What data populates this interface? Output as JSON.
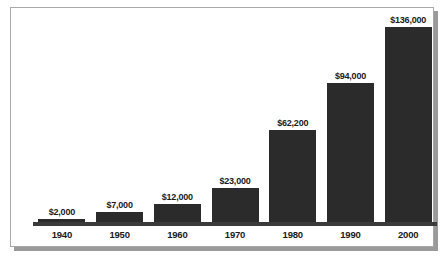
{
  "chart_data": {
    "type": "bar",
    "title": "",
    "subtitle": "",
    "xlabel": "",
    "ylabel": "",
    "categories": [
      "1940",
      "1950",
      "1960",
      "1970",
      "1980",
      "1990",
      "2000"
    ],
    "values": [
      2000,
      7000,
      12000,
      23000,
      62200,
      94000,
      136000
    ],
    "value_labels": [
      "$2,000",
      "$7,000",
      "$12,000",
      "$23,000",
      "$62,200",
      "$94,000",
      "$136,000"
    ],
    "ylim": [
      0,
      136000
    ],
    "grid": false,
    "legend": null,
    "legend_position": "none",
    "annotations": [],
    "bar_color": "#2b2b2b",
    "background_color": "#ffffff",
    "axis_color": "#3a3a3a",
    "frame_color": "#a8a8a8",
    "shadow_color": "#9a9a9a",
    "label_color": "#1a1a1a"
  }
}
